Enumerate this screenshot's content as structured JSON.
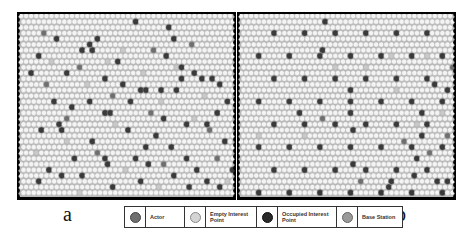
{
  "figure": {
    "panels": [
      {
        "id": "a",
        "label": "a",
        "description": "random distribution of interest points",
        "occupied": [
          [
            7,
            4
          ],
          [
            15,
            4
          ],
          [
            22,
            1
          ],
          [
            12,
            6
          ],
          [
            13,
            5
          ],
          [
            14,
            6
          ],
          [
            19,
            8
          ],
          [
            3,
            7
          ],
          [
            2,
            10
          ],
          [
            9,
            10
          ],
          [
            16,
            11
          ],
          [
            23,
            13
          ],
          [
            24,
            13
          ],
          [
            27,
            13
          ],
          [
            21,
            15
          ],
          [
            6,
            15
          ],
          [
            10,
            16
          ],
          [
            4,
            20
          ],
          [
            7,
            19
          ],
          [
            8,
            20
          ],
          [
            16,
            17
          ],
          [
            17,
            17
          ],
          [
            20,
            12
          ],
          [
            13,
            15
          ],
          [
            28,
            7
          ],
          [
            31,
            9
          ],
          [
            34,
            10
          ],
          [
            37,
            11
          ],
          [
            35,
            11
          ],
          [
            30,
            13
          ],
          [
            31,
            11
          ],
          [
            39,
            12
          ],
          [
            40,
            15
          ],
          [
            38,
            17
          ],
          [
            36,
            19
          ],
          [
            32,
            19
          ],
          [
            28,
            18
          ],
          [
            26,
            21
          ],
          [
            21,
            20
          ],
          [
            24,
            23
          ],
          [
            29,
            2
          ],
          [
            30,
            4
          ],
          [
            14,
            22
          ],
          [
            16,
            25
          ],
          [
            17,
            26
          ],
          [
            12,
            28
          ],
          [
            8,
            28
          ],
          [
            5,
            27
          ],
          [
            3,
            29
          ],
          [
            10,
            25
          ],
          [
            22,
            25
          ],
          [
            25,
            26
          ],
          [
            23,
            29
          ],
          [
            18,
            30
          ],
          [
            29,
            23
          ],
          [
            32,
            25
          ],
          [
            34,
            27
          ],
          [
            36,
            29
          ],
          [
            40,
            22
          ],
          [
            41,
            27
          ],
          [
            39,
            30
          ],
          [
            33,
            30
          ],
          [
            30,
            28
          ]
        ],
        "actors": [
          [
            4,
            3
          ],
          [
            11,
            9
          ],
          [
            5,
            12
          ],
          [
            18,
            14
          ],
          [
            26,
            6
          ],
          [
            33,
            5
          ],
          [
            37,
            20
          ],
          [
            25,
            17
          ],
          [
            15,
            24
          ],
          [
            9,
            18
          ],
          [
            28,
            26
          ],
          [
            38,
            25
          ]
        ],
        "empty_points": [
          [
            6,
            8
          ],
          [
            13,
            12
          ],
          [
            20,
            6
          ],
          [
            24,
            10
          ],
          [
            9,
            22
          ],
          [
            18,
            19
          ],
          [
            27,
            15
          ],
          [
            34,
            18
          ],
          [
            30,
            9
          ],
          [
            36,
            14
          ],
          [
            20,
            27
          ],
          [
            11,
            31
          ],
          [
            27,
            30
          ],
          [
            40,
            29
          ],
          [
            3,
            24
          ],
          [
            17,
            8
          ]
        ]
      },
      {
        "id": "b",
        "label": "b",
        "description": "regular grid distribution of interest points",
        "occupied": [
          [
            6,
            3
          ],
          [
            12,
            3
          ],
          [
            18,
            3
          ],
          [
            24,
            3
          ],
          [
            30,
            3
          ],
          [
            36,
            3
          ],
          [
            3,
            7
          ],
          [
            9,
            7
          ],
          [
            15,
            7
          ],
          [
            21,
            7
          ],
          [
            27,
            7
          ],
          [
            33,
            7
          ],
          [
            39,
            7
          ],
          [
            6,
            11
          ],
          [
            12,
            11
          ],
          [
            18,
            11
          ],
          [
            24,
            11
          ],
          [
            30,
            11
          ],
          [
            36,
            11
          ],
          [
            3,
            15
          ],
          [
            9,
            15
          ],
          [
            15,
            15
          ],
          [
            21,
            15
          ],
          [
            27,
            15
          ],
          [
            33,
            15
          ],
          [
            39,
            15
          ],
          [
            6,
            19
          ],
          [
            12,
            19
          ],
          [
            18,
            19
          ],
          [
            24,
            19
          ],
          [
            30,
            19
          ],
          [
            36,
            19
          ],
          [
            3,
            23
          ],
          [
            9,
            23
          ],
          [
            15,
            23
          ],
          [
            21,
            23
          ],
          [
            27,
            23
          ],
          [
            33,
            23
          ],
          [
            39,
            23
          ],
          [
            6,
            27
          ],
          [
            12,
            27
          ],
          [
            18,
            27
          ],
          [
            24,
            27
          ],
          [
            30,
            27
          ],
          [
            36,
            27
          ],
          [
            3,
            31
          ],
          [
            9,
            31
          ],
          [
            15,
            31
          ],
          [
            21,
            31
          ],
          [
            27,
            31
          ],
          [
            33,
            31
          ],
          [
            39,
            31
          ],
          [
            16,
            1
          ],
          [
            16,
            6
          ],
          [
            38,
            12
          ],
          [
            40,
            13
          ],
          [
            21,
            13
          ],
          [
            11,
            17
          ],
          [
            21,
            17
          ],
          [
            22,
            20
          ],
          [
            22,
            26
          ],
          [
            35,
            17
          ],
          [
            35,
            21
          ],
          [
            34,
            25
          ],
          [
            34,
            28
          ],
          [
            29,
            29
          ],
          [
            29,
            30
          ],
          [
            38,
            29
          ],
          [
            40,
            29
          ]
        ],
        "actors": [
          [
            16,
            18
          ],
          [
            41,
            9
          ],
          [
            23,
            29
          ],
          [
            40,
            21
          ],
          [
            32,
            22
          ],
          [
            37,
            24
          ]
        ],
        "empty_points": [
          [
            29,
            7
          ],
          [
            36,
            7
          ],
          [
            3,
            21
          ],
          [
            12,
            21
          ],
          [
            30,
            13
          ],
          [
            42,
            14
          ],
          [
            39,
            17
          ],
          [
            34,
            19
          ],
          [
            18,
            9
          ],
          [
            24,
            9
          ]
        ]
      }
    ],
    "legend": {
      "items": [
        {
          "label": "Actor",
          "color": "#6f6f6f",
          "shape": "hexagon"
        },
        {
          "label": "Empty Interest Point",
          "color": "#c9c9c9",
          "shape": "hexagon"
        },
        {
          "label": "Occupied Interest Point",
          "color": "#3a3a3a",
          "shape": "hexagon"
        },
        {
          "label": "Base Station",
          "color": "#9a9a9a",
          "shape": "hexagon"
        }
      ]
    },
    "colors": {
      "cell_fill": "#f4f4f4",
      "cell_stroke": "#a8a8a8",
      "grid_background": "#b9b9b9",
      "border": "#000000"
    }
  }
}
